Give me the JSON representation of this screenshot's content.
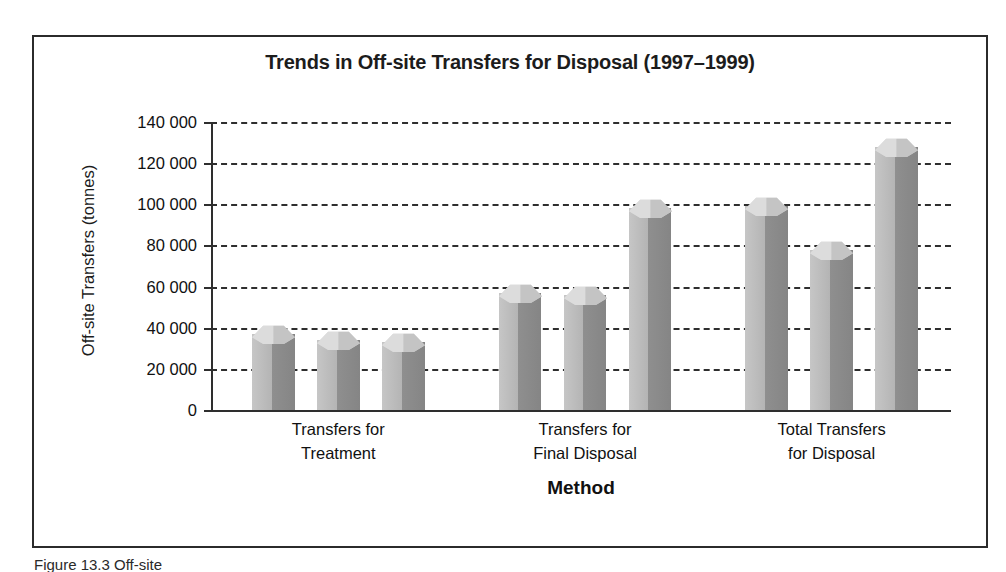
{
  "figure": {
    "caption_fragment": "Figure 13.3  Off-site"
  },
  "chart_data": {
    "type": "bar",
    "title": "Trends in Off-site Transfers for Disposal (1997–1999)",
    "xlabel": "Method",
    "ylabel": "Off-site Transfers (tonnes)",
    "ylim": [
      0,
      140000
    ],
    "ytick_step": 20000,
    "ytick_labels": [
      "140 000",
      "120 000",
      "100 000",
      "80 000",
      "60 000",
      "40 000",
      "20 000",
      "0"
    ],
    "ytick_values": [
      140000,
      120000,
      100000,
      80000,
      60000,
      40000,
      20000,
      0
    ],
    "grid": true,
    "legend": "none",
    "categories": [
      "Transfers for Treatment",
      "Transfers for Final Disposal",
      "Total Transfers for Disposal"
    ],
    "category_lines": [
      [
        "Transfers for",
        "Treatment"
      ],
      [
        "Transfers for",
        "Final Disposal"
      ],
      [
        "Total Transfers",
        "for Disposal"
      ]
    ],
    "series": [
      {
        "name": "1997",
        "values": [
          37000,
          57000,
          99000
        ]
      },
      {
        "name": "1998",
        "values": [
          34000,
          56000,
          78000
        ]
      },
      {
        "name": "1999",
        "values": [
          33000,
          98000,
          128000
        ]
      }
    ],
    "bars_flat": [
      {
        "group": 0,
        "series": 0,
        "value": 37000
      },
      {
        "group": 0,
        "series": 1,
        "value": 34000
      },
      {
        "group": 0,
        "series": 2,
        "value": 33000
      },
      {
        "group": 1,
        "series": 0,
        "value": 57000
      },
      {
        "group": 1,
        "series": 1,
        "value": 56000
      },
      {
        "group": 1,
        "series": 2,
        "value": 98000
      },
      {
        "group": 2,
        "series": 0,
        "value": 99000
      },
      {
        "group": 2,
        "series": 1,
        "value": 78000
      },
      {
        "group": 2,
        "series": 2,
        "value": 128000
      }
    ],
    "colors": {
      "bar_face_left": "#bcbcbc",
      "bar_face_right": "#8b8b8b",
      "bar_top": "#d2d2d2",
      "axis": "#2e2e2e",
      "text": "#111111",
      "frame": "#2b2b2b",
      "background": "#ffffff"
    }
  }
}
